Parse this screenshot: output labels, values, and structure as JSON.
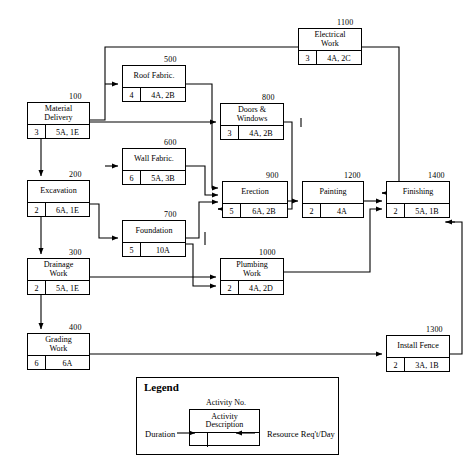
{
  "diagram": {
    "type": "precedence-network-diagram",
    "nodes": [
      {
        "id": "100",
        "title1": "Material",
        "title2": "Delivery",
        "duration": "3",
        "resource": "5A, 1E",
        "x": 27,
        "y": 102,
        "w": 63,
        "h": 37,
        "num_x": 69,
        "num_y": 92
      },
      {
        "id": "200",
        "title1": "Excavation",
        "title2": "",
        "duration": "2",
        "resource": "6A, 1E",
        "x": 27,
        "y": 180,
        "w": 63,
        "h": 37,
        "num_x": 69,
        "num_y": 170
      },
      {
        "id": "300",
        "title1": "Drainage",
        "title2": "Work",
        "duration": "2",
        "resource": "5A, 1E",
        "x": 27,
        "y": 258,
        "w": 63,
        "h": 37,
        "num_x": 69,
        "num_y": 248
      },
      {
        "id": "400",
        "title1": "Grading",
        "title2": "Work",
        "duration": "6",
        "resource": "6A",
        "x": 27,
        "y": 333,
        "w": 63,
        "h": 37,
        "num_x": 69,
        "num_y": 323
      },
      {
        "id": "500",
        "title1": "Roof Fabric.",
        "title2": "",
        "duration": "4",
        "resource": "4A, 2B",
        "x": 122,
        "y": 65,
        "w": 64,
        "h": 37,
        "num_x": 164,
        "num_y": 55
      },
      {
        "id": "600",
        "title1": "Wall Fabric.",
        "title2": "",
        "duration": "6",
        "resource": "5A, 3B",
        "x": 122,
        "y": 148,
        "w": 64,
        "h": 37,
        "num_x": 164,
        "num_y": 138
      },
      {
        "id": "700",
        "title1": "Foundation",
        "title2": "",
        "duration": "5",
        "resource": "10A",
        "x": 122,
        "y": 220,
        "w": 64,
        "h": 37,
        "num_x": 164,
        "num_y": 210
      },
      {
        "id": "800",
        "title1": "Doors &",
        "title2": "Windows",
        "duration": "3",
        "resource": "4A, 2B",
        "x": 220,
        "y": 103,
        "w": 64,
        "h": 37,
        "num_x": 262,
        "num_y": 93
      },
      {
        "id": "900",
        "title1": "Erection",
        "title2": "",
        "duration": "5",
        "resource": "6A, 2B",
        "x": 222,
        "y": 181,
        "w": 66,
        "h": 37,
        "num_x": 266,
        "num_y": 171
      },
      {
        "id": "1000",
        "title1": "Plumbing",
        "title2": "Work",
        "duration": "2",
        "resource": "4A, 2D",
        "x": 220,
        "y": 258,
        "w": 64,
        "h": 37,
        "num_x": 259,
        "num_y": 248
      },
      {
        "id": "1100",
        "title1": "Electrical",
        "title2": "Work",
        "duration": "3",
        "resource": "4A, 2C",
        "x": 298,
        "y": 28,
        "w": 64,
        "h": 37,
        "num_x": 337,
        "num_y": 18
      },
      {
        "id": "1200",
        "title1": "Painting",
        "title2": "",
        "duration": "2",
        "resource": "4A",
        "x": 302,
        "y": 181,
        "w": 62,
        "h": 37,
        "num_x": 344,
        "num_y": 171
      },
      {
        "id": "1300",
        "title1": "Install Fence",
        "title2": "",
        "duration": "2",
        "resource": "3A, 1B",
        "x": 386,
        "y": 335,
        "w": 64,
        "h": 37,
        "num_x": 426,
        "num_y": 325
      },
      {
        "id": "1400",
        "title1": "Finishing",
        "title2": "",
        "duration": "2",
        "resource": "5A, 1B",
        "x": 386,
        "y": 181,
        "w": 64,
        "h": 37,
        "num_x": 428,
        "num_y": 171
      }
    ]
  },
  "legend": {
    "title": "Legend",
    "activity_no_label": "Activity No.",
    "description_line1": "Activity",
    "description_line2": "Description",
    "duration_label": "Duration",
    "resource_label": "Resource  Req't/Day"
  },
  "colors": {
    "line": "#000000",
    "background": "#ffffff"
  }
}
